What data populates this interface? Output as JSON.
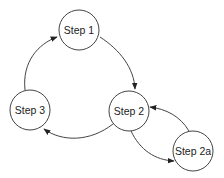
{
  "diagram": {
    "type": "cycle-flow",
    "nodes": [
      {
        "id": "step1",
        "label": "Step 1",
        "cx": 79,
        "cy": 30,
        "r": 20
      },
      {
        "id": "step2",
        "label": "Step 2",
        "cx": 129,
        "cy": 111,
        "r": 20
      },
      {
        "id": "step3",
        "label": "Step 3",
        "cx": 30,
        "cy": 110,
        "r": 20
      },
      {
        "id": "step2a",
        "label": "Step 2a",
        "cx": 193,
        "cy": 151,
        "r": 20
      }
    ],
    "edges": [
      {
        "from": "step1",
        "to": "step2"
      },
      {
        "from": "step2",
        "to": "step3"
      },
      {
        "from": "step3",
        "to": "step1"
      },
      {
        "from": "step2",
        "to": "step2a"
      },
      {
        "from": "step2a",
        "to": "step2"
      }
    ],
    "colors": {
      "stroke": "#444444",
      "fill": "#ffffff",
      "text": "#222222"
    }
  }
}
